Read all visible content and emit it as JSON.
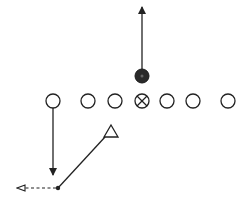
{
  "diagram": {
    "type": "football-play",
    "colors": {
      "ink": "#222222",
      "background": "#ffffff"
    },
    "offensive_line": [
      {
        "x": 53,
        "y": 101,
        "symbol": "circle",
        "role": "end"
      },
      {
        "x": 88,
        "y": 101,
        "symbol": "circle",
        "role": "tackle"
      },
      {
        "x": 115,
        "y": 101,
        "symbol": "circle",
        "role": "guard"
      },
      {
        "x": 142,
        "y": 101,
        "symbol": "circle-x",
        "role": "center"
      },
      {
        "x": 167,
        "y": 101,
        "symbol": "circle",
        "role": "guard"
      },
      {
        "x": 193,
        "y": 101,
        "symbol": "circle",
        "role": "tackle"
      },
      {
        "x": 228,
        "y": 101,
        "symbol": "circle",
        "role": "end"
      }
    ],
    "ball_carrier": {
      "x": 142,
      "y": 76,
      "symbol": "filled-circle"
    },
    "defender": {
      "x": 111,
      "y": 131,
      "symbol": "triangle"
    },
    "routes": [
      {
        "from": [
          142,
          69
        ],
        "to": [
          142,
          6
        ],
        "style": "solid",
        "arrow": "filled"
      },
      {
        "from": [
          53,
          108
        ],
        "to": [
          53,
          175
        ],
        "style": "solid",
        "arrow": "filled"
      },
      {
        "from": [
          106,
          138
        ],
        "to": [
          58,
          188
        ],
        "style": "solid",
        "arrow": "none"
      },
      {
        "from": [
          58,
          188
        ],
        "to": [
          15,
          188
        ],
        "style": "dashed",
        "arrow": "open"
      }
    ],
    "pivot_point": {
      "x": 58,
      "y": 188
    }
  }
}
